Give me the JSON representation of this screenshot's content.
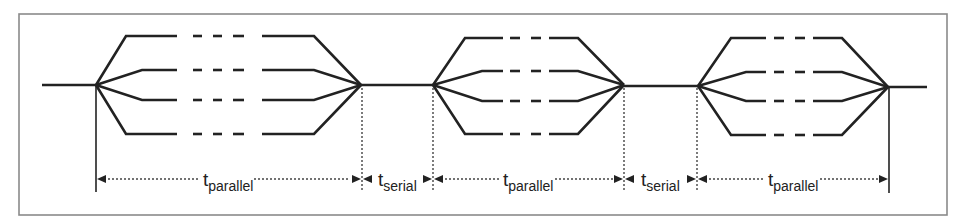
{
  "diagram": {
    "colors": {
      "line": "#222222",
      "frame": "#8a8a8a",
      "background": "#ffffff"
    },
    "parallel_sections": [
      {
        "id": "parallel-1",
        "fork_x": 96,
        "join_x": 361
      },
      {
        "id": "parallel-2",
        "fork_x": 433,
        "join_x": 624
      },
      {
        "id": "parallel-3",
        "fork_x": 698,
        "join_x": 888
      }
    ],
    "branches_per_section": 4,
    "labels": [
      {
        "id": "label-parallel-1",
        "base": "t",
        "sub": "parallel"
      },
      {
        "id": "label-serial-1",
        "base": "t",
        "sub": "serial"
      },
      {
        "id": "label-parallel-2",
        "base": "t",
        "sub": "parallel"
      },
      {
        "id": "label-serial-2",
        "base": "t",
        "sub": "serial"
      },
      {
        "id": "label-parallel-3",
        "base": "t",
        "sub": "parallel"
      }
    ]
  }
}
